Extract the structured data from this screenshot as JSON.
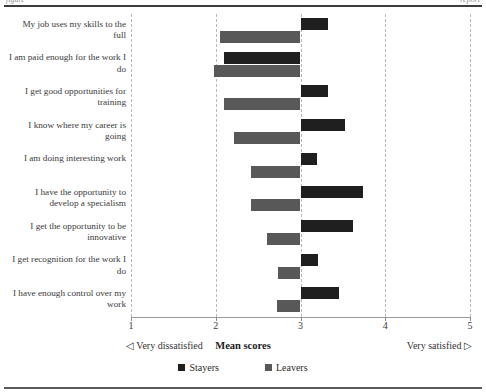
{
  "page": {
    "artifact_top_left": "figure",
    "artifact_top_right": "report"
  },
  "axis": {
    "tick_labels": [
      "1",
      "2",
      "3",
      "4",
      "5"
    ],
    "left_caption": "◁ Very dissatisfied",
    "center_caption": "Mean scores",
    "right_caption": "Very satisfied ▷"
  },
  "legend": {
    "items": [
      {
        "label": "Stayers",
        "color": "#1f1f1f",
        "icon": "square-swatch-icon"
      },
      {
        "label": "Leavers",
        "color": "#585858",
        "icon": "square-swatch-icon"
      }
    ]
  },
  "chart_data": {
    "type": "bar",
    "orientation": "horizontal",
    "title": "",
    "subtitle": "",
    "xlabel": "Mean scores",
    "ylabel": "",
    "xlim": [
      1,
      5
    ],
    "xticks": [
      1,
      2,
      3,
      4,
      5
    ],
    "baseline": 3,
    "grid": true,
    "grid_style": "dashed vertical at each integer tick",
    "legend_position": "bottom-center",
    "annotations": [
      "◁ Very dissatisfied",
      "Very satisfied ▷"
    ],
    "categories": [
      "My job uses my skills to the full",
      "I am paid enough for the work I do",
      "I get good opportunities for training",
      "I know where my career is going",
      "I am doing interesting work",
      "I have the opportunity to develop a specialism",
      "I get the opportunity to be innovative",
      "I get recognition for the work I do",
      "I have enough control over my work"
    ],
    "series": [
      {
        "name": "Stayers",
        "color": "#1f1f1f",
        "values": [
          3.33,
          2.1,
          3.32,
          3.53,
          3.2,
          3.74,
          3.62,
          3.21,
          3.45
        ]
      },
      {
        "name": "Leavers",
        "color": "#585858",
        "values": [
          2.05,
          1.98,
          2.1,
          2.22,
          2.42,
          2.42,
          2.6,
          2.73,
          2.72
        ]
      }
    ]
  }
}
